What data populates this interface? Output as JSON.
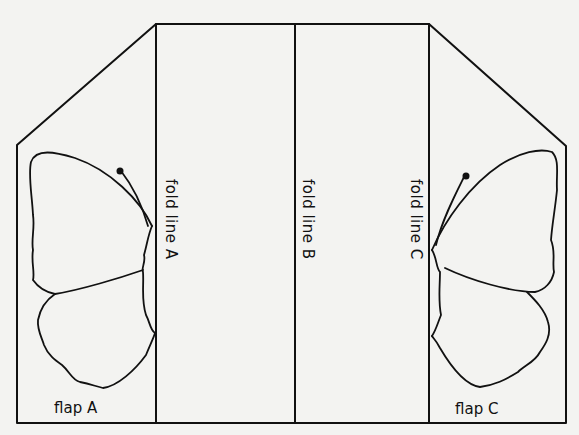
{
  "diagram": {
    "fold_lines": [
      {
        "id": "A",
        "label": "fold line A"
      },
      {
        "id": "B",
        "label": "fold line B"
      },
      {
        "id": "C",
        "label": "fold line C"
      }
    ],
    "flaps": [
      {
        "id": "A",
        "label": "flap A"
      },
      {
        "id": "C",
        "label": "flap C"
      }
    ],
    "colors": {
      "line": "#111111",
      "paper": "#f3f3f1",
      "bleed_text": "#d9d9d6"
    }
  }
}
